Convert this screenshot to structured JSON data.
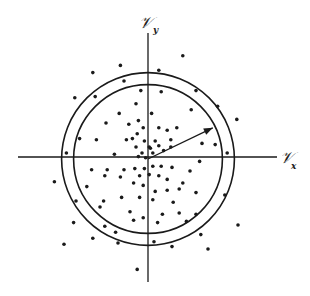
{
  "diagram": {
    "type": "scatter",
    "axes": {
      "x_label": "𝒱",
      "x_subscript": "x",
      "y_label": "𝒱",
      "y_subscript": "y"
    },
    "circles": [
      {
        "name": "inner",
        "radius_units": 6.2
      },
      {
        "name": "outer",
        "radius_units": 7.2
      }
    ],
    "vector": {
      "from": [
        0,
        0
      ],
      "to": [
        5.4,
        2.6
      ]
    },
    "colors": {
      "ink": "#1a1a1a",
      "background": "#ffffff"
    },
    "points": [
      [
        -4.6,
        7.2
      ],
      [
        -2.3,
        7.8
      ],
      [
        2.9,
        8.6
      ],
      [
        0.9,
        7.4
      ],
      [
        -2.0,
        6.5
      ],
      [
        4.0,
        5.7
      ],
      [
        -0.6,
        5.7
      ],
      [
        1.1,
        5.6
      ],
      [
        -6.1,
        5.1
      ],
      [
        -4.4,
        5.2
      ],
      [
        -1.0,
        4.6
      ],
      [
        3.6,
        4.1
      ],
      [
        -2.4,
        3.8
      ],
      [
        0.3,
        3.8
      ],
      [
        -0.8,
        3.2
      ],
      [
        5.8,
        4.4
      ],
      [
        7.4,
        3.3
      ],
      [
        -3.5,
        3.0
      ],
      [
        -1.6,
        2.9
      ],
      [
        0.9,
        2.6
      ],
      [
        -0.4,
        2.6
      ],
      [
        2.4,
        2.6
      ],
      [
        -0.9,
        2.1
      ],
      [
        1.6,
        2.4
      ],
      [
        4.5,
        1.3
      ],
      [
        -1.3,
        1.7
      ],
      [
        1.9,
        1.6
      ],
      [
        -0.3,
        1.5
      ],
      [
        0.6,
        1.5
      ],
      [
        -1.0,
        1.0
      ],
      [
        0.1,
        1.0
      ],
      [
        0.9,
        1.1
      ],
      [
        -0.5,
        0.5
      ],
      [
        0.4,
        0.5
      ],
      [
        -0.2,
        0.1
      ],
      [
        -0.8,
        0.2
      ],
      [
        0.2,
        0.9
      ],
      [
        1.3,
        0.7
      ],
      [
        1.9,
        1.0
      ],
      [
        -5.7,
        1.7
      ],
      [
        -4.3,
        1.6
      ],
      [
        -1.8,
        1.6
      ],
      [
        -6.8,
        0.5
      ],
      [
        -2.8,
        0.4
      ],
      [
        6.6,
        0.5
      ],
      [
        4.3,
        -0.2
      ],
      [
        5.6,
        1.2
      ],
      [
        -4.7,
        -0.9
      ],
      [
        -3.4,
        -0.9
      ],
      [
        -2.0,
        -0.9
      ],
      [
        -1.1,
        -0.8
      ],
      [
        -0.3,
        -0.8
      ],
      [
        0.4,
        -0.6
      ],
      [
        1.1,
        -0.6
      ],
      [
        2.0,
        -0.7
      ],
      [
        3.5,
        -1.0
      ],
      [
        -0.7,
        -1.4
      ],
      [
        0.1,
        -1.3
      ],
      [
        0.9,
        -1.4
      ],
      [
        -3.6,
        -1.4
      ],
      [
        -2.3,
        -1.5
      ],
      [
        1.6,
        -1.7
      ],
      [
        2.9,
        -2.0
      ],
      [
        -1.2,
        -2.0
      ],
      [
        -0.4,
        -2.2
      ],
      [
        -5.1,
        -2.3
      ],
      [
        -7.8,
        -1.9
      ],
      [
        -6.0,
        -3.5
      ],
      [
        0.6,
        -2.7
      ],
      [
        1.6,
        -2.6
      ],
      [
        2.6,
        -2.5
      ],
      [
        4.0,
        -2.8
      ],
      [
        6.4,
        -3.0
      ],
      [
        -3.7,
        -3.5
      ],
      [
        -2.2,
        -3.2
      ],
      [
        -0.7,
        -3.2
      ],
      [
        0.4,
        -3.4
      ],
      [
        2.1,
        -3.6
      ],
      [
        -4.0,
        -4.0
      ],
      [
        -1.5,
        -4.4
      ],
      [
        -0.4,
        -4.9
      ],
      [
        1.2,
        -4.6
      ],
      [
        2.6,
        -4.5
      ],
      [
        4.0,
        -4.6
      ],
      [
        -1.2,
        -5.1
      ],
      [
        0.8,
        -5.3
      ],
      [
        3.2,
        -5.2
      ],
      [
        -3.6,
        -5.6
      ],
      [
        -2.7,
        -6.1
      ],
      [
        4.4,
        -6.3
      ],
      [
        -6.2,
        -5.3
      ],
      [
        -4.6,
        -6.6
      ],
      [
        -2.5,
        -7.0
      ],
      [
        0.5,
        -6.9
      ],
      [
        2.0,
        -7.3
      ],
      [
        5.0,
        -7.5
      ],
      [
        -0.9,
        -9.2
      ],
      [
        -7.0,
        -7.1
      ],
      [
        7.5,
        -5.5
      ]
    ]
  }
}
